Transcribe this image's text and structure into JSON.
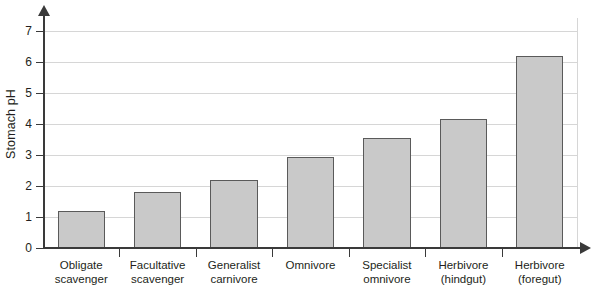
{
  "chart_data": {
    "type": "bar",
    "title": "",
    "xlabel": "",
    "ylabel": "Stomach pH",
    "ylim": [
      0,
      7.5
    ],
    "yticks": [
      0,
      1,
      2,
      3,
      4,
      5,
      6,
      7
    ],
    "ytick_labels": [
      "0",
      "1",
      "2",
      "3",
      "4",
      "5",
      "6",
      "7"
    ],
    "grid": true,
    "legend": null,
    "categories": [
      "Obligate scavenger",
      "Facultative scavenger",
      "Generalist carnivore",
      "Omnivore",
      "Specialist omnivore",
      "Herbivore (hindgut)",
      "Herbivore (foregut)"
    ],
    "category_lines": [
      [
        "Obligate",
        "scavenger"
      ],
      [
        "Facultative",
        "scavenger"
      ],
      [
        "Generalist",
        "carnivore"
      ],
      [
        "Omnivore",
        ""
      ],
      [
        "Specialist",
        "omnivore"
      ],
      [
        "Herbivore",
        "(hindgut)"
      ],
      [
        "Herbivore",
        "(foregut)"
      ]
    ],
    "values": [
      1.2,
      1.8,
      2.2,
      2.95,
      3.55,
      4.15,
      6.2
    ],
    "bar_fill": "#c9c9c9",
    "bar_edge": "#5a5a5a",
    "grid_color": "#d6d6d6",
    "axis_color": "#3a3a3a",
    "text_color": "#231f20"
  }
}
